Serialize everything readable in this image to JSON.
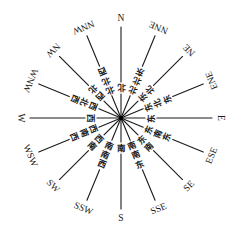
{
  "diagram": {
    "directions": [
      {
        "abbr": "N",
        "cn": "北",
        "bearing": 0
      },
      {
        "abbr": "NNE",
        "cn": "北北东",
        "bearing": 22.5
      },
      {
        "abbr": "NE",
        "cn": "东北",
        "bearing": 45
      },
      {
        "abbr": "ENE",
        "cn": "东北东",
        "bearing": 67.5
      },
      {
        "abbr": "E",
        "cn": "东",
        "bearing": 90
      },
      {
        "abbr": "ESE",
        "cn": "东南东",
        "bearing": 112.5
      },
      {
        "abbr": "SE",
        "cn": "东南",
        "bearing": 135
      },
      {
        "abbr": "SSE",
        "cn": "南南东",
        "bearing": 157.5
      },
      {
        "abbr": "S",
        "cn": "南",
        "bearing": 180
      },
      {
        "abbr": "SSW",
        "cn": "南南西",
        "bearing": 202.5
      },
      {
        "abbr": "SW",
        "cn": "西南",
        "bearing": 225
      },
      {
        "abbr": "WSW",
        "cn": "西南西",
        "bearing": 247.5
      },
      {
        "abbr": "W",
        "cn": "西",
        "bearing": 270
      },
      {
        "abbr": "WNW",
        "cn": "西北西",
        "bearing": 292.5
      },
      {
        "abbr": "NW",
        "cn": "西北",
        "bearing": 315
      },
      {
        "abbr": "NNW",
        "cn": "北北西",
        "bearing": 337.5
      }
    ]
  }
}
